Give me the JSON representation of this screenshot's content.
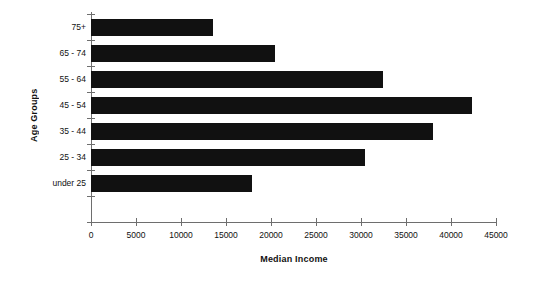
{
  "chart_data": {
    "type": "bar",
    "orientation": "horizontal",
    "title": "",
    "xlabel": "Median Income",
    "ylabel": "Age Groups",
    "categories": [
      "under 25",
      "25 - 34",
      "35 - 44",
      "45 - 54",
      "55 - 64",
      "65 - 74",
      "75+"
    ],
    "values": [
      17900,
      30400,
      38000,
      42300,
      32400,
      20400,
      13500
    ],
    "xlim": [
      0,
      45000
    ],
    "xticks": [
      0,
      5000,
      10000,
      15000,
      20000,
      25000,
      30000,
      35000,
      40000,
      45000
    ],
    "xtick_labels": [
      "0",
      "5000",
      "10000",
      "15000",
      "20000",
      "25000",
      "30000",
      "35000",
      "40000",
      "45000"
    ],
    "grid": false,
    "legend": false,
    "bar_color": "#111111",
    "axis_color": "#6e6e6e",
    "background_color": "#ffffff"
  }
}
